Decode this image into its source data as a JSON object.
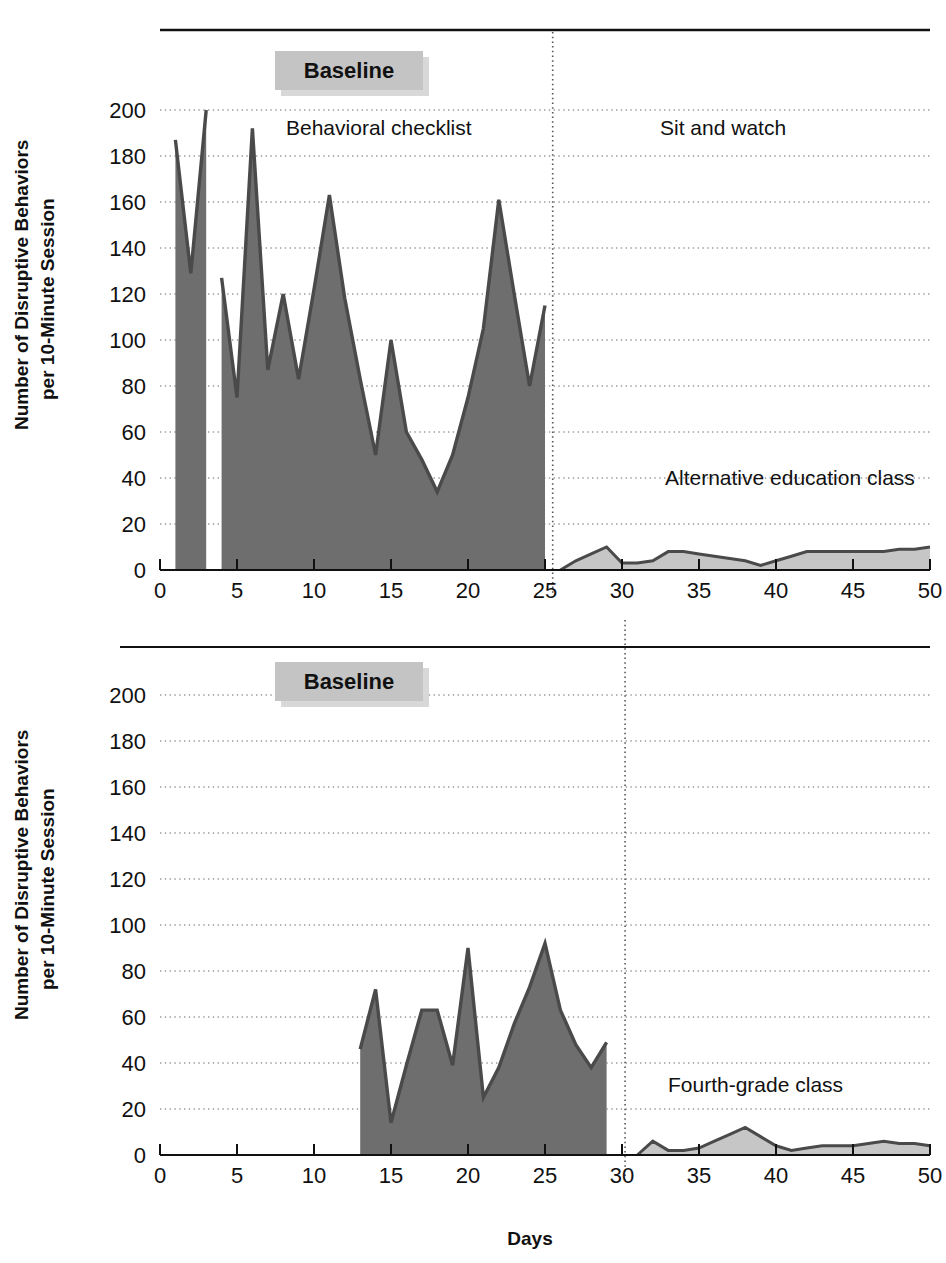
{
  "figure": {
    "xlabel": "Days",
    "ylabel_line1": "Number of Disruptive Behaviors",
    "ylabel_line2": "per 10-Minute Session",
    "baseline_box_label": "Baseline",
    "colors": {
      "baseline_fill": "#6e6e6e",
      "intervention_fill": "#c6c6c6",
      "line_stroke": "#4a4a4a",
      "axis": "#111111",
      "grid": "#9a9a9a",
      "box_fill": "#c4c4c4",
      "box_shadow": "#d8d8d8"
    },
    "y_ticks": [
      0,
      20,
      40,
      60,
      80,
      100,
      120,
      140,
      160,
      180,
      200
    ],
    "x_ticks": [
      0,
      5,
      10,
      15,
      20,
      25,
      30,
      35,
      40,
      45,
      50
    ]
  },
  "chart_data": [
    {
      "id": "top-panel",
      "type": "area",
      "title": "",
      "xlabel": "",
      "ylabel": "Number of Disruptive Behaviors per 10-Minute Session",
      "xlim": [
        0,
        50
      ],
      "ylim": [
        0,
        200
      ],
      "grid": true,
      "legend": "none",
      "phase_line_x": 25.5,
      "annotations": [
        {
          "text": "Baseline",
          "x": 11,
          "y": 228,
          "style": "box"
        },
        {
          "text": "Behavioral checklist",
          "x": 12.5,
          "y": 190,
          "style": "plain"
        },
        {
          "text": "Sit and watch",
          "x": 37,
          "y": 190,
          "style": "plain"
        },
        {
          "text": "Alternative education class",
          "x": 40,
          "y": 34,
          "style": "plain"
        }
      ],
      "series": [
        {
          "name": "Baseline - Behavioral checklist",
          "phase": "baseline",
          "fill": "#6e6e6e",
          "x": [
            1,
            2,
            3
          ],
          "values": [
            187,
            129,
            200
          ]
        },
        {
          "name": "Baseline - Behavioral checklist (cont.)",
          "phase": "baseline",
          "fill": "#6e6e6e",
          "x": [
            4,
            5,
            6,
            7,
            8,
            9,
            10,
            11,
            12,
            13,
            14,
            15,
            16,
            17,
            18,
            19,
            20,
            21,
            22,
            23,
            24,
            25
          ],
          "values": [
            127,
            75,
            192,
            87,
            120,
            83,
            122,
            163,
            118,
            83,
            50,
            100,
            60,
            48,
            34,
            50,
            75,
            105,
            161,
            120,
            80,
            115
          ]
        },
        {
          "name": "Sit and watch - Alternative education class",
          "phase": "intervention",
          "fill": "#c6c6c6",
          "x": [
            26,
            27,
            28,
            29,
            30,
            31,
            32,
            33,
            34,
            35,
            36,
            37,
            38,
            39,
            40,
            41,
            42,
            43,
            44,
            45,
            46,
            47,
            48,
            49,
            50
          ],
          "values": [
            0,
            4,
            7,
            10,
            3,
            3,
            4,
            8,
            8,
            7,
            6,
            5,
            4,
            2,
            4,
            6,
            8,
            8,
            8,
            8,
            8,
            8,
            9,
            9,
            10
          ]
        }
      ]
    },
    {
      "id": "bottom-panel",
      "type": "area",
      "title": "",
      "xlabel": "Days",
      "ylabel": "Number of Disruptive Behaviors per 10-Minute Session",
      "xlim": [
        0,
        50
      ],
      "ylim": [
        0,
        200
      ],
      "grid": true,
      "legend": "none",
      "phase_line_x": 30.2,
      "annotations": [
        {
          "text": "Baseline",
          "x": 11,
          "y": 228,
          "style": "box"
        },
        {
          "text": "Fourth-grade class",
          "x": 38,
          "y": 26,
          "style": "plain"
        }
      ],
      "series": [
        {
          "name": "Baseline",
          "phase": "baseline",
          "fill": "#6e6e6e",
          "x": [
            13,
            14,
            15,
            16,
            17,
            18,
            19,
            20,
            21,
            22,
            23,
            24,
            25,
            26,
            27,
            28,
            29
          ],
          "values": [
            46,
            72,
            14,
            39,
            63,
            63,
            39,
            90,
            25,
            38,
            57,
            73,
            92,
            63,
            48,
            38,
            49
          ]
        },
        {
          "name": "Fourth-grade class",
          "phase": "intervention",
          "fill": "#c6c6c6",
          "x": [
            31,
            32,
            33,
            34,
            35,
            36,
            37,
            38,
            39,
            40,
            41,
            42,
            43,
            44,
            45,
            46,
            47,
            48,
            49,
            50
          ],
          "values": [
            0,
            6,
            2,
            2,
            3,
            6,
            9,
            12,
            8,
            4,
            2,
            3,
            4,
            4,
            4,
            5,
            6,
            5,
            5,
            4
          ]
        }
      ]
    }
  ]
}
